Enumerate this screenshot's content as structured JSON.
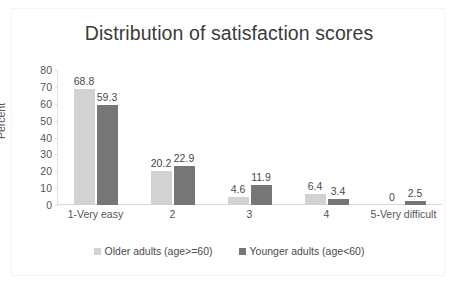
{
  "chart_data": {
    "type": "bar",
    "title": "Distribution of satisfaction scores",
    "xlabel": "",
    "ylabel": "Percent",
    "categories": [
      "1-Very easy",
      "2",
      "3",
      "4",
      "5-Very difficult"
    ],
    "series": [
      {
        "name": "Older adults (age>=60)",
        "color": "#d2d2d2",
        "values": [
          68.8,
          20.2,
          4.6,
          6.4,
          0
        ],
        "labels": [
          "68.8",
          "20.2",
          "4.6",
          "6.4",
          "0"
        ]
      },
      {
        "name": "Younger adults (age<60)",
        "color": "#767676",
        "values": [
          59.3,
          22.9,
          11.9,
          3.4,
          2.5
        ],
        "labels": [
          "59.3",
          "22.9",
          "11.9",
          "3.4",
          "2.5"
        ]
      }
    ],
    "ylim": [
      0,
      80
    ],
    "yticks": [
      0,
      10,
      20,
      30,
      40,
      50,
      60,
      70,
      80
    ],
    "ytick_labels": [
      "0",
      "10",
      "20",
      "30",
      "40",
      "50",
      "60",
      "70",
      "80"
    ],
    "grid": false,
    "legend_position": "bottom"
  }
}
